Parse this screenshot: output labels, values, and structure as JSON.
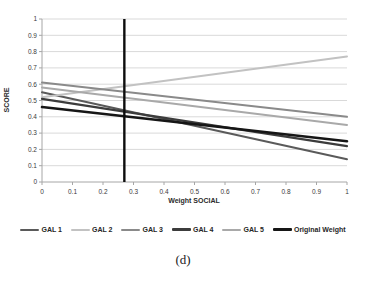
{
  "figure": {
    "caption": "(d)"
  },
  "chart_data": {
    "type": "line",
    "title": "",
    "xlabel": "Weight SOCIAL",
    "ylabel": "SCORE",
    "xlim": [
      0,
      1
    ],
    "ylim": [
      0,
      1
    ],
    "xticks": [
      "0",
      "0.1",
      "0.2",
      "0.3",
      "0.4",
      "0.5",
      "0.6",
      "0.7",
      "0.8",
      "0.9",
      "1"
    ],
    "yticks": [
      "0",
      "0.1",
      "0.2",
      "0.3",
      "0.4",
      "0.5",
      "0.6",
      "0.7",
      "0.8",
      "0.9",
      "1"
    ],
    "grid": "horizontal",
    "gridline_color": "#d9d9d9",
    "axis_color": "#a6a6a6",
    "legend_position": "bottom",
    "series": [
      {
        "name": "GAL 1",
        "color": "#5a5a5a",
        "width": 2,
        "x": [
          0,
          1
        ],
        "y": [
          0.55,
          0.14
        ]
      },
      {
        "name": "GAL 2",
        "color": "#c2c2c2",
        "width": 2,
        "x": [
          0,
          1
        ],
        "y": [
          0.52,
          0.77
        ]
      },
      {
        "name": "GAL 3",
        "color": "#8a8a8a",
        "width": 2,
        "x": [
          0,
          1
        ],
        "y": [
          0.61,
          0.4
        ]
      },
      {
        "name": "GAL 4",
        "color": "#3c3c3c",
        "width": 2.2,
        "x": [
          0,
          1
        ],
        "y": [
          0.51,
          0.22
        ]
      },
      {
        "name": "GAL 5",
        "color": "#a9a9a9",
        "width": 2,
        "x": [
          0,
          1
        ],
        "y": [
          0.58,
          0.35
        ]
      },
      {
        "name": "Original Weight",
        "color": "#161616",
        "width": 2.6,
        "x": [
          0,
          1
        ],
        "y": [
          0.46,
          0.25
        ]
      }
    ],
    "reference_line": {
      "axis": "x",
      "value": 0.27,
      "color": "#0d0d0d",
      "width": 2.4
    }
  }
}
